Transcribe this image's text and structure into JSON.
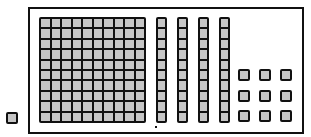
{
  "diagram": {
    "hundreds_flat": {
      "count": 1,
      "rows": 10,
      "cols": 10
    },
    "tens_rods": {
      "count": 4,
      "units_per_rod": 10,
      "x_positions": [
        156,
        177,
        198,
        219
      ]
    },
    "unit_cubes_inside": {
      "count": 9,
      "rows": 3,
      "cols": 3,
      "positions": [
        [
          238,
          69
        ],
        [
          259,
          69
        ],
        [
          280,
          69
        ],
        [
          238,
          90
        ],
        [
          259,
          90
        ],
        [
          280,
          90
        ],
        [
          238,
          110
        ],
        [
          259,
          110
        ],
        [
          280,
          110
        ]
      ]
    },
    "unit_cube_outside": {
      "count": 1,
      "position": [
        6,
        112
      ]
    },
    "colors": {
      "block_fill": "#c6c6c6",
      "outline": "#111111",
      "background": "#ffffff"
    }
  }
}
